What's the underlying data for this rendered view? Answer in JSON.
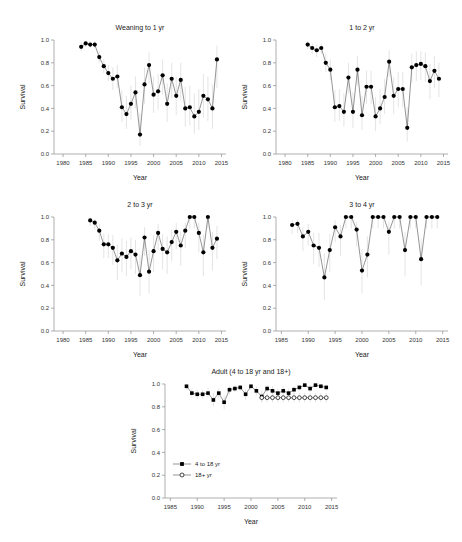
{
  "figure": {
    "background": "#ffffff",
    "marker_color": "#000000",
    "line_color": "#4d4d4d",
    "errorbar_color": "#d8d8d8",
    "axis_color": "#8c8c8c"
  },
  "chart_data": [
    {
      "type": "line",
      "title": "Weaning to 1 yr",
      "xlabel": "Year",
      "ylabel": "Survival",
      "xlim": [
        1978,
        2016
      ],
      "ylim": [
        0.0,
        1.0
      ],
      "xticks": [
        1980,
        1985,
        1990,
        1995,
        2000,
        2005,
        2010,
        2015
      ],
      "yticks": [
        0.0,
        0.2,
        0.4,
        0.6,
        0.8,
        1.0
      ],
      "grid": false,
      "legend": "none",
      "series": [
        {
          "name": "Weaning to 1 yr",
          "marker": "filled-circle",
          "x": [
            1984,
            1985,
            1986,
            1987,
            1988,
            1989,
            1990,
            1991,
            1992,
            1993,
            1994,
            1995,
            1996,
            1997,
            1998,
            1999,
            2000,
            2001,
            2002,
            2003,
            2004,
            2005,
            2006,
            2007,
            2008,
            2009,
            2010,
            2011,
            2012,
            2013,
            2014
          ],
          "values": [
            0.94,
            0.97,
            0.96,
            0.96,
            0.85,
            0.77,
            0.71,
            0.66,
            0.68,
            0.41,
            0.35,
            0.44,
            0.54,
            0.17,
            0.61,
            0.78,
            0.52,
            0.55,
            0.69,
            0.44,
            0.66,
            0.51,
            0.65,
            0.4,
            0.41,
            0.33,
            0.37,
            0.51,
            0.48,
            0.4,
            0.83
          ],
          "err_low": [
            0.9,
            0.94,
            0.93,
            0.93,
            0.8,
            0.71,
            0.64,
            0.56,
            0.58,
            0.28,
            0.22,
            0.3,
            0.4,
            0.07,
            0.44,
            0.62,
            0.36,
            0.39,
            0.52,
            0.28,
            0.49,
            0.34,
            0.47,
            0.24,
            0.25,
            0.18,
            0.21,
            0.32,
            0.29,
            0.22,
            0.58
          ],
          "err_high": [
            0.98,
            0.99,
            0.99,
            0.99,
            0.9,
            0.83,
            0.78,
            0.76,
            0.78,
            0.56,
            0.51,
            0.6,
            0.68,
            0.36,
            0.76,
            0.89,
            0.68,
            0.7,
            0.83,
            0.62,
            0.8,
            0.68,
            0.8,
            0.59,
            0.6,
            0.53,
            0.57,
            0.7,
            0.68,
            0.61,
            0.95
          ]
        }
      ]
    },
    {
      "type": "line",
      "title": "1 to 2 yr",
      "xlabel": "Year",
      "ylabel": "Survival",
      "xlim": [
        1978,
        2016
      ],
      "ylim": [
        0.0,
        1.0
      ],
      "xticks": [
        1980,
        1985,
        1990,
        1995,
        2000,
        2005,
        2010,
        2015
      ],
      "yticks": [
        0.0,
        0.2,
        0.4,
        0.6,
        0.8,
        1.0
      ],
      "grid": false,
      "legend": "none",
      "series": [
        {
          "name": "1 to 2 yr",
          "marker": "filled-circle",
          "x": [
            1985,
            1986,
            1987,
            1988,
            1989,
            1990,
            1991,
            1992,
            1993,
            1994,
            1995,
            1996,
            1997,
            1998,
            1999,
            2000,
            2001,
            2002,
            2003,
            2004,
            2005,
            2006,
            2007,
            2008,
            2009,
            2010,
            2011,
            2012,
            2013,
            2014
          ],
          "values": [
            0.96,
            0.93,
            0.91,
            0.93,
            0.8,
            0.74,
            0.41,
            0.42,
            0.37,
            0.67,
            0.37,
            0.74,
            0.34,
            0.59,
            0.59,
            0.33,
            0.4,
            0.5,
            0.81,
            0.51,
            0.57,
            0.57,
            0.23,
            0.76,
            0.78,
            0.79,
            0.77,
            0.64,
            0.73,
            0.66
          ],
          "err_low": [
            0.92,
            0.88,
            0.85,
            0.88,
            0.72,
            0.65,
            0.28,
            0.29,
            0.24,
            0.53,
            0.23,
            0.6,
            0.21,
            0.44,
            0.44,
            0.2,
            0.26,
            0.35,
            0.68,
            0.35,
            0.41,
            0.41,
            0.11,
            0.62,
            0.64,
            0.65,
            0.63,
            0.48,
            0.58,
            0.5
          ],
          "err_high": [
            0.99,
            0.97,
            0.96,
            0.97,
            0.88,
            0.83,
            0.56,
            0.57,
            0.53,
            0.8,
            0.54,
            0.86,
            0.51,
            0.73,
            0.73,
            0.5,
            0.57,
            0.66,
            0.91,
            0.67,
            0.72,
            0.72,
            0.41,
            0.88,
            0.9,
            0.9,
            0.89,
            0.79,
            0.86,
            0.8
          ]
        }
      ]
    },
    {
      "type": "line",
      "title": "2 to 3 yr",
      "xlabel": "Year",
      "ylabel": "Survival",
      "xlim": [
        1978,
        2016
      ],
      "ylim": [
        0.0,
        1.0
      ],
      "xticks": [
        1980,
        1985,
        1990,
        1995,
        2000,
        2005,
        2010,
        2015
      ],
      "yticks": [
        0.0,
        0.2,
        0.4,
        0.6,
        0.8,
        1.0
      ],
      "grid": false,
      "legend": "none",
      "series": [
        {
          "name": "2 to 3 yr",
          "marker": "filled-circle",
          "x": [
            1986,
            1987,
            1988,
            1989,
            1990,
            1991,
            1992,
            1993,
            1994,
            1995,
            1996,
            1997,
            1998,
            1999,
            2000,
            2001,
            2002,
            2003,
            2004,
            2005,
            2006,
            2007,
            2008,
            2009,
            2010,
            2011,
            2012,
            2013,
            2014
          ],
          "values": [
            0.97,
            0.95,
            0.88,
            0.76,
            0.76,
            0.73,
            0.62,
            0.68,
            0.65,
            0.7,
            0.67,
            0.49,
            0.82,
            0.52,
            0.7,
            0.86,
            0.72,
            0.69,
            0.78,
            0.87,
            0.75,
            0.88,
            1.0,
            1.0,
            0.86,
            0.69,
            1.0,
            0.73,
            0.81
          ],
          "err_low": [
            0.92,
            0.89,
            0.79,
            0.64,
            0.64,
            0.58,
            0.45,
            0.52,
            0.48,
            0.54,
            0.5,
            0.31,
            0.66,
            0.33,
            0.52,
            0.71,
            0.54,
            0.5,
            0.61,
            0.72,
            0.57,
            0.73,
            0.9,
            0.9,
            0.69,
            0.48,
            0.9,
            0.53,
            0.63
          ],
          "err_high": [
            0.99,
            0.98,
            0.94,
            0.85,
            0.85,
            0.84,
            0.76,
            0.81,
            0.79,
            0.82,
            0.8,
            0.67,
            0.91,
            0.71,
            0.84,
            0.94,
            0.85,
            0.83,
            0.89,
            0.95,
            0.87,
            0.95,
            1.0,
            1.0,
            0.95,
            0.84,
            1.0,
            0.87,
            0.92
          ]
        }
      ]
    },
    {
      "type": "line",
      "title": "3 to 4 yr",
      "xlabel": "Year",
      "ylabel": "Survival",
      "xlim": [
        1984,
        2016
      ],
      "ylim": [
        0.0,
        1.0
      ],
      "xticks": [
        1985,
        1990,
        1995,
        2000,
        2005,
        2010,
        2015
      ],
      "yticks": [
        0.0,
        0.2,
        0.4,
        0.6,
        0.8,
        1.0
      ],
      "grid": false,
      "legend": "none",
      "series": [
        {
          "name": "3 to 4 yr",
          "marker": "filled-circle",
          "x": [
            1987,
            1988,
            1989,
            1990,
            1991,
            1992,
            1993,
            1994,
            1995,
            1996,
            1997,
            1998,
            1999,
            2000,
            2001,
            2002,
            2003,
            2004,
            2005,
            2006,
            2007,
            2008,
            2009,
            2010,
            2011,
            2012,
            2013,
            2014
          ],
          "values": [
            0.93,
            0.94,
            0.83,
            0.87,
            0.75,
            0.73,
            0.47,
            0.71,
            0.91,
            0.83,
            1.0,
            1.0,
            0.89,
            0.53,
            0.67,
            1.0,
            1.0,
            1.0,
            0.87,
            1.0,
            1.0,
            0.71,
            1.0,
            1.0,
            0.63,
            1.0,
            1.0,
            1.0
          ],
          "err_low": [
            0.85,
            0.86,
            0.7,
            0.75,
            0.59,
            0.56,
            0.27,
            0.52,
            0.78,
            0.66,
            0.9,
            0.9,
            0.74,
            0.33,
            0.47,
            0.9,
            0.9,
            0.9,
            0.67,
            0.9,
            0.9,
            0.48,
            0.9,
            0.9,
            0.4,
            0.9,
            0.9,
            0.9
          ],
          "err_high": [
            0.97,
            0.98,
            0.91,
            0.94,
            0.86,
            0.86,
            0.68,
            0.85,
            0.97,
            0.93,
            1.0,
            1.0,
            0.96,
            0.72,
            0.83,
            1.0,
            1.0,
            1.0,
            0.96,
            1.0,
            1.0,
            0.87,
            1.0,
            1.0,
            0.81,
            1.0,
            1.0,
            1.0
          ]
        }
      ]
    },
    {
      "type": "line",
      "title": "Adult (4 to 18 yr and 18+)",
      "xlabel": "Year",
      "ylabel": "Survival",
      "xlim": [
        1984,
        2016
      ],
      "ylim": [
        0.0,
        1.0
      ],
      "xticks": [
        1985,
        1990,
        1995,
        2000,
        2005,
        2010,
        2015
      ],
      "yticks": [
        0.0,
        0.2,
        0.4,
        0.6,
        0.8,
        1.0
      ],
      "grid": false,
      "legend": "inside-bottom-left",
      "series": [
        {
          "name": "4 to 18 yr",
          "marker": "filled-square",
          "x": [
            1988,
            1989,
            1990,
            1991,
            1992,
            1993,
            1994,
            1995,
            1996,
            1997,
            1998,
            1999,
            2000,
            2001,
            2002,
            2003,
            2004,
            2005,
            2006,
            2007,
            2008,
            2009,
            2010,
            2011,
            2012,
            2013,
            2014
          ],
          "values": [
            0.98,
            0.92,
            0.91,
            0.91,
            0.92,
            0.86,
            0.92,
            0.84,
            0.95,
            0.96,
            0.97,
            0.91,
            0.98,
            0.94,
            0.89,
            0.96,
            0.94,
            0.92,
            0.94,
            0.92,
            0.95,
            0.97,
            0.99,
            0.96,
            0.99,
            0.98,
            0.97
          ],
          "err_low": [
            0.95,
            0.88,
            0.87,
            0.87,
            0.88,
            0.8,
            0.87,
            0.78,
            0.91,
            0.93,
            0.94,
            0.86,
            0.95,
            0.9,
            0.84,
            0.93,
            0.9,
            0.88,
            0.91,
            0.88,
            0.91,
            0.94,
            0.97,
            0.93,
            0.97,
            0.96,
            0.94
          ],
          "err_high": [
            1.0,
            0.96,
            0.95,
            0.95,
            0.96,
            0.92,
            0.96,
            0.9,
            0.98,
            0.99,
            0.99,
            0.95,
            1.0,
            0.98,
            0.94,
            0.99,
            0.98,
            0.96,
            0.98,
            0.96,
            0.98,
            0.99,
            1.0,
            0.99,
            1.0,
            1.0,
            0.99
          ]
        },
        {
          "name": "18+ yr",
          "marker": "open-circle",
          "x": [
            2002,
            2003,
            2004,
            2005,
            2006,
            2007,
            2008,
            2009,
            2010,
            2011,
            2012,
            2013,
            2014
          ],
          "values": [
            0.88,
            0.88,
            0.88,
            0.88,
            0.88,
            0.88,
            0.88,
            0.88,
            0.88,
            0.88,
            0.88,
            0.88,
            0.88
          ],
          "err_low": [
            0.84,
            0.84,
            0.84,
            0.84,
            0.84,
            0.84,
            0.84,
            0.84,
            0.84,
            0.84,
            0.84,
            0.84,
            0.84
          ],
          "err_high": [
            0.92,
            0.92,
            0.92,
            0.92,
            0.92,
            0.92,
            0.92,
            0.92,
            0.92,
            0.92,
            0.92,
            0.92,
            0.92
          ]
        }
      ]
    }
  ]
}
